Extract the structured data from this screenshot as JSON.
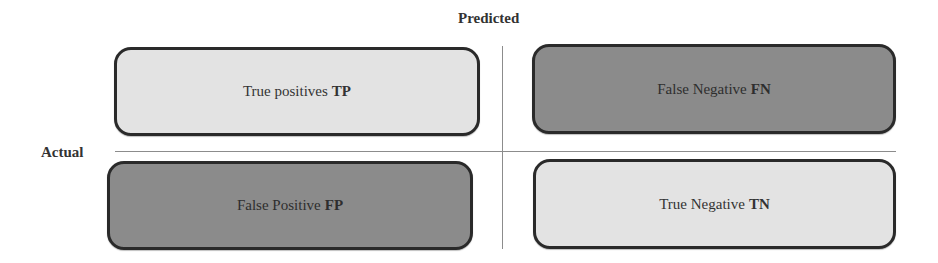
{
  "axes": {
    "column_header": "Predicted",
    "row_header": "Actual"
  },
  "cells": [
    {
      "id": "tp",
      "label": "True positives",
      "abbr": "TP",
      "shade": "light",
      "fill": "#e3e3e3"
    },
    {
      "id": "fn",
      "label": "False Negative",
      "abbr": "FN",
      "shade": "dark",
      "fill": "#8b8b8b"
    },
    {
      "id": "fp",
      "label": "False Positive",
      "abbr": "FP",
      "shade": "dark",
      "fill": "#8b8b8b"
    },
    {
      "id": "tn",
      "label": "True Negative",
      "abbr": "TN",
      "shade": "light",
      "fill": "#e3e3e3"
    }
  ],
  "colors": {
    "border": "#2a2a2a",
    "divider": "#8c8c8c",
    "light_fill": "#e3e3e3",
    "dark_fill": "#8b8b8b"
  }
}
